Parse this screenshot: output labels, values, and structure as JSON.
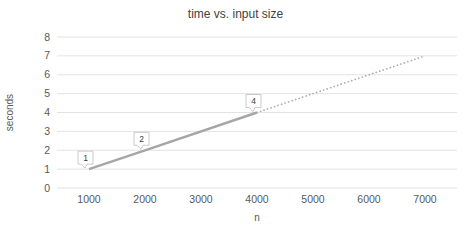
{
  "chart_data": {
    "type": "line",
    "title": "time vs. input size",
    "xlabel": "n",
    "ylabel": "seconds",
    "xlim": [
      500,
      7500
    ],
    "ylim": [
      0,
      8
    ],
    "x_ticks": [
      1000,
      2000,
      3000,
      4000,
      5000,
      6000,
      7000
    ],
    "y_ticks": [
      0,
      1,
      2,
      3,
      4,
      5,
      6,
      7,
      8
    ],
    "grid": "horizontal",
    "legend": "none",
    "series": [
      {
        "name": "measured",
        "style": "solid",
        "color": "#a6a6a6",
        "line_width": 2.4,
        "points": [
          {
            "x": 1000,
            "y": 1,
            "label": "1"
          },
          {
            "x": 2000,
            "y": 2,
            "label": "2"
          },
          {
            "x": 4000,
            "y": 4,
            "label": "4"
          }
        ]
      },
      {
        "name": "extrapolated",
        "style": "dotted",
        "color": "#ababab",
        "line_width": 1.7,
        "points": [
          {
            "x": 4000,
            "y": 4
          },
          {
            "x": 7000,
            "y": 7
          }
        ]
      }
    ],
    "colors": {
      "background": "#ffffff",
      "gridline": "#e3e3e3",
      "title_text": "#3f3f3f",
      "tick_text": "#595959",
      "callout_fill": "#ffffff",
      "callout_border": "#c9c9c9",
      "callout_text": "#404040"
    }
  }
}
